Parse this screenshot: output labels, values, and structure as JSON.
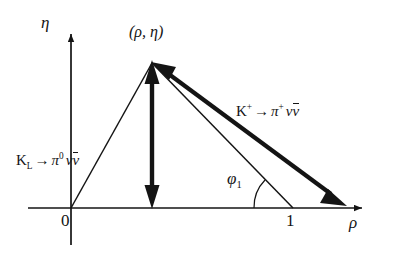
{
  "figure": {
    "background_color": "#ffffff",
    "stroke_color": "#141414"
  },
  "axes": {
    "x_axis": {
      "label": "ρ",
      "name": "rho-axis"
    },
    "y_axis": {
      "label": "η",
      "name": "eta-axis"
    },
    "origin_tick": {
      "label": "0"
    },
    "unit_tick": {
      "label": "1",
      "value": 1
    }
  },
  "annotations": {
    "apex_label": "(ρ, η)",
    "angle_label_base": "φ",
    "angle_label_sub": "1",
    "kl_decay": {
      "parent": "K",
      "parent_sub": "L",
      "arrow": "→",
      "daughter_pi": "π",
      "daughter_pi_sup": "0",
      "nu": "ν",
      "nubar": "ν"
    },
    "kplus_decay": {
      "parent": "K",
      "parent_sup": "+",
      "arrow": "→",
      "daughter_pi": "π",
      "daughter_pi_sup": "+",
      "nu": "ν",
      "nubar": "ν"
    }
  },
  "geometry": {
    "origin_px": "71,208",
    "apex_px": "152,63",
    "unit_point_px": "293,208",
    "thick_arrow_end_px": "345,205",
    "x_axis_span_px": "28 to 370",
    "y_axis_span_px": "245 to 27"
  }
}
